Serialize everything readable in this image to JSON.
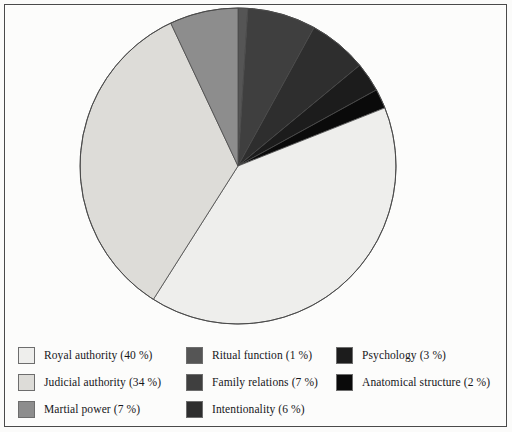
{
  "chart_data": {
    "type": "pie",
    "title": "",
    "legend_position": "bottom",
    "start_angle_deg": 0,
    "direction": "clockwise",
    "categories": [
      "Royal authority",
      "Judicial authority",
      "Martial power",
      "Ritual function",
      "Family relations",
      "Intentionality",
      "Psychology",
      "Anatomical structure"
    ],
    "values": [
      40,
      34,
      7,
      1,
      7,
      6,
      3,
      2
    ],
    "unit": "%",
    "slices": [
      {
        "key": "ritual-function",
        "label": "Ritual function",
        "value": 1,
        "value_text": "(1 %)",
        "legend_text": "Ritual function (1 %)",
        "color": "#555555",
        "start_deg": 0,
        "end_deg": 3.6
      },
      {
        "key": "family-relations",
        "label": "Family relations",
        "value": 7,
        "value_text": "(7 %)",
        "legend_text": "Family relations (7 %)",
        "color": "#3f3f3f",
        "start_deg": 3.6,
        "end_deg": 28.8
      },
      {
        "key": "intentionality",
        "label": "Intentionality",
        "value": 6,
        "value_text": "(6 %)",
        "legend_text": "Intentionality (6 %)",
        "color": "#2e2e2e",
        "start_deg": 28.8,
        "end_deg": 50.4
      },
      {
        "key": "psychology",
        "label": "Psychology",
        "value": 3,
        "value_text": "(3 %)",
        "legend_text": "Psychology (3 %)",
        "color": "#1c1c1c",
        "start_deg": 50.4,
        "end_deg": 61.2
      },
      {
        "key": "anatomical-structure",
        "label": "Anatomical structure",
        "value": 2,
        "value_text": "(2 %)",
        "legend_text": "Anatomical structure (2 %)",
        "color": "#0a0a0a",
        "start_deg": 61.2,
        "end_deg": 68.4
      },
      {
        "key": "royal-authority",
        "label": "Royal authority",
        "value": 40,
        "value_text": "(40 %)",
        "legend_text": "Royal authority (40 %)",
        "color": "#eeeeec",
        "start_deg": 68.4,
        "end_deg": 212.4
      },
      {
        "key": "judicial-authority",
        "label": "Judicial authority",
        "value": 34,
        "value_text": "(34 %)",
        "legend_text": "Judicial authority (34 %)",
        "color": "#dddcd8",
        "start_deg": 212.4,
        "end_deg": 334.8
      },
      {
        "key": "martial-power",
        "label": "Martial power",
        "value": 7,
        "value_text": "(7 %)",
        "legend_text": "Martial power (7 %)",
        "color": "#8d8d8d",
        "start_deg": 334.8,
        "end_deg": 360
      }
    ]
  },
  "legend": {
    "columns": [
      [
        {
          "swatch_color": "#eeeeec",
          "text": "Royal authority (40 %)",
          "key": "royal-authority"
        },
        {
          "swatch_color": "#dddcd8",
          "text": "Judicial authority (34 %)",
          "key": "judicial-authority"
        },
        {
          "swatch_color": "#8d8d8d",
          "text": "Martial power (7 %)",
          "key": "martial-power"
        }
      ],
      [
        {
          "swatch_color": "#555555",
          "text": "Ritual function (1 %)",
          "key": "ritual-function"
        },
        {
          "swatch_color": "#3f3f3f",
          "text": "Family relations (7 %)",
          "key": "family-relations"
        },
        {
          "swatch_color": "#2e2e2e",
          "text": "Intentionality (6 %)",
          "key": "intentionality"
        }
      ],
      [
        {
          "swatch_color": "#1c1c1c",
          "text": "Psychology (3 %)",
          "key": "psychology"
        },
        {
          "swatch_color": "#0a0a0a",
          "text": "Anatomical structure (2 %)",
          "key": "anatomical-structure"
        }
      ]
    ]
  },
  "geometry": {
    "center_x": 238,
    "center_y": 166,
    "radius": 158,
    "outline_color": "#4a4a4a"
  }
}
